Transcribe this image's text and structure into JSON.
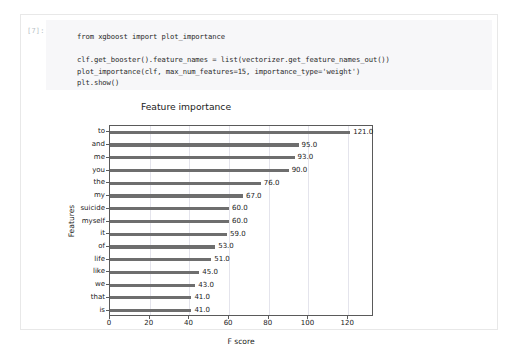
{
  "notebook": {
    "prompt_label": "[7]:",
    "code": "from xgboost import plot_importance\n\nclf.get_booster().feature_names = list(vectorizer.get_feature_names_out())\nplot_importance(clf, max_num_features=15, importance_type='weight')\nplt.show()"
  },
  "chart_data": {
    "type": "bar",
    "orientation": "horizontal",
    "title": "Feature importance",
    "xlabel": "F score",
    "ylabel": "Features",
    "categories": [
      "to",
      "and",
      "me",
      "you",
      "the",
      "my",
      "suicide",
      "myself",
      "it",
      "of",
      "life",
      "like",
      "we",
      "that",
      "is"
    ],
    "values": [
      121.0,
      95.0,
      93.0,
      90.0,
      76.0,
      67.0,
      60.0,
      60.0,
      59.0,
      53.0,
      51.0,
      45.0,
      43.0,
      41.0,
      41.0
    ],
    "value_labels": [
      "121.0",
      "95.0",
      "93.0",
      "90.0",
      "76.0",
      "67.0",
      "60.0",
      "60.0",
      "59.0",
      "53.0",
      "51.0",
      "45.0",
      "43.0",
      "41.0",
      "41.0"
    ],
    "xticks": [
      0,
      20,
      40,
      60,
      80,
      100,
      120
    ],
    "xtick_labels": [
      "0",
      "20",
      "40",
      "60",
      "80",
      "100",
      "120"
    ],
    "xlim": [
      0,
      133
    ],
    "grid": true,
    "legend": null,
    "bar_color": "#6e6e6e",
    "grid_color": "#e4e4ec",
    "axis_color": "#5a5a5a"
  }
}
